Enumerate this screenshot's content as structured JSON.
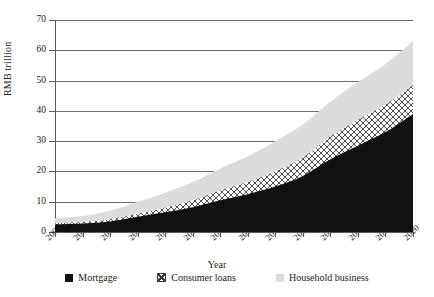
{
  "chart_data": {
    "type": "area",
    "title": "",
    "subtitle": "",
    "xlabel": "Year",
    "ylabel": "RMB trillion",
    "stacked": true,
    "grid": true,
    "legend_position": "bottom",
    "xlim": [
      2007,
      2020
    ],
    "ylim": [
      0,
      70
    ],
    "yticks": [
      0,
      10,
      20,
      30,
      40,
      50,
      60,
      70
    ],
    "categories": [
      "2007",
      "2008",
      "2009",
      "2010",
      "2011",
      "2012",
      "2013",
      "2014",
      "2015",
      "2016",
      "2017",
      "2018",
      "2019",
      "2020"
    ],
    "series": [
      {
        "name": "Mortgage",
        "color": "#111111",
        "pattern": "solid",
        "values": [
          2.5,
          2.8,
          3.5,
          5.0,
          6.5,
          8.2,
          10.5,
          12.5,
          15.0,
          18.5,
          24.0,
          28.5,
          33.0,
          39.0
        ]
      },
      {
        "name": "Consumer loans",
        "color": "#ffffff",
        "pattern": "crosshatch",
        "values": [
          0.4,
          0.5,
          0.7,
          1.0,
          1.5,
          2.3,
          3.2,
          4.0,
          5.0,
          6.0,
          7.5,
          8.5,
          9.0,
          9.5
        ]
      },
      {
        "name": "Household business",
        "color": "#dcdcdc",
        "pattern": "solid",
        "values": [
          1.6,
          2.0,
          2.8,
          4.0,
          5.0,
          6.0,
          7.3,
          8.5,
          10.0,
          11.0,
          11.5,
          12.5,
          13.5,
          14.5
        ]
      }
    ],
    "totals": [
      4.5,
      5.3,
      7.0,
      10.0,
      13.0,
      16.5,
      21.0,
      25.0,
      30.0,
      35.5,
      43.0,
      49.5,
      55.5,
      63.0
    ]
  },
  "axis": {
    "y_title": "RMB trillion",
    "x_title": "Year",
    "y_tick_labels": [
      "0",
      "10",
      "20",
      "30",
      "40",
      "50",
      "60",
      "70"
    ],
    "x_tick_labels": [
      "2007",
      "2008",
      "2009",
      "2010",
      "2011",
      "2012",
      "2013",
      "2014",
      "2015",
      "2016",
      "2017",
      "2018",
      "2019",
      "2020"
    ]
  },
  "legend": {
    "items": [
      {
        "label": "Mortgage",
        "swatch": "black-square-icon"
      },
      {
        "label": "Consumer loans",
        "swatch": "crosshatch-square-icon"
      },
      {
        "label": "Household business",
        "swatch": "gray-square-icon"
      }
    ]
  },
  "colors": {
    "mortgage": "#111111",
    "consumer_loans": "#ffffff",
    "consumer_loans_hatch": "#3a3a3a",
    "household_business": "#dcdcdc",
    "grid": "#6e6e6e",
    "axis": "#5a5a5a",
    "text": "#1a1a1a",
    "background": "#ffffff"
  }
}
